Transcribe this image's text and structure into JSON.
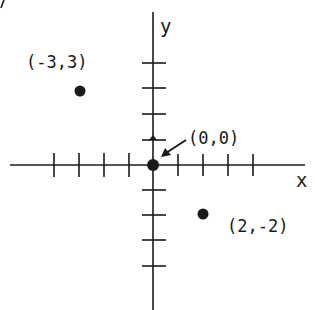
{
  "diagram": {
    "type": "coordinate-plane",
    "axes": {
      "x_label": "x",
      "y_label": "y",
      "x_ticks": [
        -4,
        -3,
        -2,
        -1,
        1,
        2,
        3,
        4
      ],
      "y_ticks": [
        4,
        3,
        2,
        1,
        -1,
        -2,
        -3,
        -4
      ]
    },
    "points": [
      {
        "x": -3,
        "y": 3,
        "label": "(-3,3)"
      },
      {
        "x": 0,
        "y": 0,
        "label": "(0,0)"
      },
      {
        "x": 2,
        "y": -2,
        "label": "(2,-2)"
      }
    ],
    "colors": {
      "ink": "#1a1a1a",
      "background": "#ffffff"
    }
  }
}
